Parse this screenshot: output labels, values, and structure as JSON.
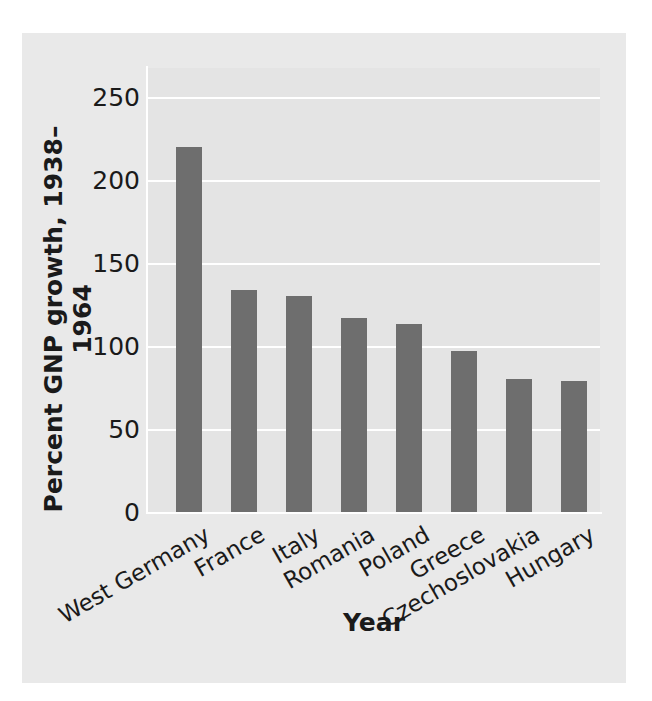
{
  "chart_data": {
    "type": "bar",
    "title": "",
    "xlabel": "Year",
    "ylabel": "Percent GNP growth, 1938–1964",
    "categories": [
      "West Germany",
      "France",
      "Italy",
      "Romania",
      "Poland",
      "Greece",
      "Czechoslovakia",
      "Hungary"
    ],
    "values": [
      220,
      134,
      130,
      117,
      113,
      97,
      80,
      79
    ],
    "ylim": [
      0,
      265
    ],
    "yticks": [
      0,
      50,
      100,
      150,
      200,
      250
    ],
    "ytick_labels": [
      "0",
      "50",
      "100",
      "150",
      "200",
      "250"
    ],
    "grid": "horizontal-white",
    "legend": "none",
    "bar_color": "#6e6e6e",
    "panel_color": "#e9e9e9",
    "plot_background": "#e4e4e4",
    "gridline_color": "#ffffff",
    "text_color": "#1a1a1a",
    "xtick_rotation_deg": 30
  }
}
